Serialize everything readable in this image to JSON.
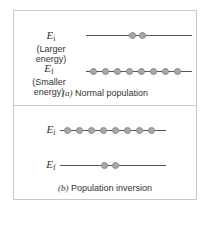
{
  "panel_a": {
    "upper_level": {
      "symbol": "E",
      "subscript": "i",
      "description": "(Larger energy)",
      "atom_count": 2
    },
    "lower_level": {
      "symbol": "E",
      "subscript": "f",
      "description": "(Smaller energy)",
      "atom_count": 8
    },
    "caption_letter": "(a)",
    "caption_text": " Normal population"
  },
  "panel_b": {
    "upper_level": {
      "symbol": "E",
      "subscript": "i",
      "atom_count": 8
    },
    "lower_level": {
      "symbol": "E",
      "subscript": "f",
      "atom_count": 2
    },
    "caption_letter": "(b)",
    "caption_text": " Population inversion"
  },
  "colors": {
    "atom": "#a8a8a8",
    "line": "#555555",
    "frame": "#c8c8c8"
  }
}
